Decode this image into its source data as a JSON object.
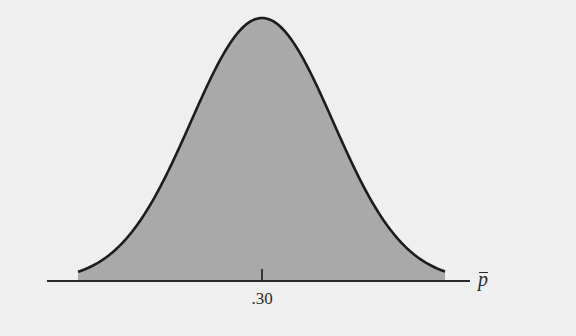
{
  "chart_data": {
    "type": "area",
    "title": "",
    "xlabel": "p̄",
    "ylabel": "",
    "x_ticks": [
      ".30"
    ],
    "mean": 0.3,
    "curve": "normal density",
    "tail_extent_sd": 2.6,
    "grid": false,
    "legend": null
  },
  "colors": {
    "background": "#efefef",
    "fill": "#a9a9a9",
    "curve": "#1c1c1c",
    "axis": "#2a2a2a"
  },
  "layout": {
    "center_x": 262,
    "axis_y": 281,
    "peak_y": 18,
    "sigma_px": 71,
    "left_x": 78,
    "right_x": 445,
    "axis_start_x": 47,
    "axis_end_x": 470,
    "tick_top_y": 269
  },
  "labels": {
    "tick": ".30",
    "axis_symbol": "p"
  }
}
